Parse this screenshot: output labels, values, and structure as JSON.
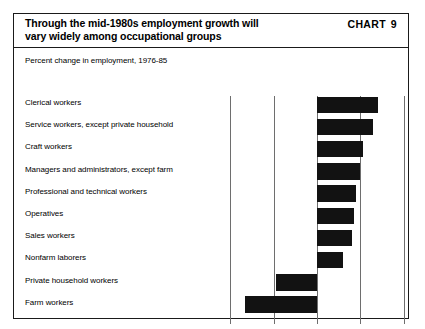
{
  "header": {
    "title_line1": "Through the mid-1980s employment growth will",
    "title_line2": "vary widely among occupational groups",
    "chart_label": "CHART",
    "chart_number": "9"
  },
  "subtitle": "Percent change in employment, 1976-85",
  "source": "Source: Bureau of Labor Statistics",
  "colors": {
    "bar": "#121212",
    "frame": "#1a1a1a",
    "gridline": "#6e6e6e",
    "background": "#ffffff"
  },
  "chart_data": {
    "type": "bar",
    "orientation": "horizontal",
    "title": "Through the mid-1980s employment growth will vary widely among occupational groups",
    "subtitle": "Percent change in employment, 1976-85",
    "xlabel": "",
    "ylabel": "",
    "xlim": [
      -40,
      40
    ],
    "xticks": [
      -40,
      -20,
      0,
      20,
      40
    ],
    "xticklabels": [
      "-40",
      "-20",
      "0",
      "20",
      "40"
    ],
    "grid": true,
    "legend": false,
    "source": "Bureau of Labor Statistics",
    "categories": [
      "Clerical workers",
      "Service workers, except private household",
      "Craft workers",
      "Managers and administrators, except farm",
      "Professional and technical workers",
      "Operatives",
      "Sales workers",
      "Nonfarm laborers",
      "Private household workers",
      "Farm workers"
    ],
    "values": [
      28,
      26,
      21,
      20,
      18,
      17,
      16,
      12,
      -19,
      -33
    ]
  }
}
